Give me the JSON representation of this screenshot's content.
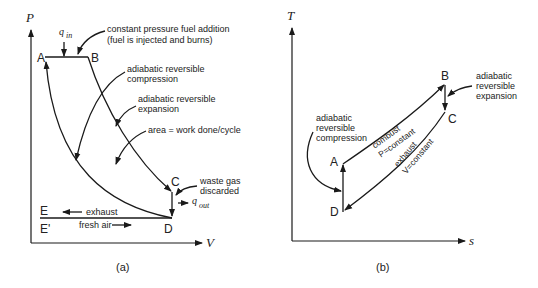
{
  "diagram_a": {
    "caption": "(a)",
    "y_axis_label": "P",
    "x_axis_label": "V",
    "points": {
      "A": "A",
      "B": "B",
      "C": "C",
      "D": "D",
      "E": "E",
      "E_prime": "E'"
    },
    "heat_in": {
      "symbol": "q",
      "subscript": "in"
    },
    "heat_out": {
      "symbol": "q",
      "subscript": "out"
    },
    "annotations": {
      "fuel_addition_line1": "constant pressure fuel addition",
      "fuel_addition_line2": "(fuel is injected and burns)",
      "compression_line1": "adiabatic reversible",
      "compression_line2": "compression",
      "expansion_line1": "adiabatic reversible",
      "expansion_line2": "expansion",
      "area": "area = work done/cycle",
      "waste_line1": "waste gas",
      "waste_line2": "discarded",
      "exhaust": "exhaust",
      "fresh_air": "fresh air"
    }
  },
  "diagram_b": {
    "caption": "(b)",
    "y_axis_label": "T",
    "x_axis_label": "s",
    "points": {
      "A": "A",
      "B": "B",
      "C": "C",
      "D": "D"
    },
    "annotations": {
      "expansion_line1": "adiabatic",
      "expansion_line2": "reversible",
      "expansion_line3": "expansion",
      "compression_line1": "adiabatic",
      "compression_line2": "reversible",
      "compression_line3": "compression",
      "combust": "combust",
      "p_constant": "P=constant",
      "exhaust": "exhaust",
      "v_constant": "V=constant"
    }
  }
}
